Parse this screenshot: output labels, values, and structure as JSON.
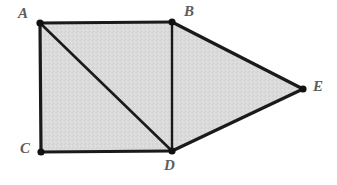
{
  "figure": {
    "canvas": {
      "width": 337,
      "height": 185
    },
    "background_color": "#ffffff",
    "fill_color": "#d9d9d9",
    "stroke_color": "#1a1a1a",
    "label_color": "#5d5d5d",
    "vertex_dot_color": "#111111",
    "vertices": [
      {
        "name": "A",
        "label": "A",
        "x": 40,
        "y": 23,
        "label_x": 18,
        "label_y": 6,
        "dot_radius": 3.6
      },
      {
        "name": "B",
        "label": "B",
        "x": 172,
        "y": 22,
        "label_x": 184,
        "label_y": 4,
        "dot_radius": 3.6
      },
      {
        "name": "C",
        "label": "C",
        "x": 41,
        "y": 152,
        "label_x": 20,
        "label_y": 141,
        "dot_radius": 3.6
      },
      {
        "name": "D",
        "label": "D",
        "x": 172,
        "y": 151,
        "label_x": 164,
        "label_y": 158,
        "dot_radius": 3.6
      },
      {
        "name": "E",
        "label": "E",
        "x": 303,
        "y": 89,
        "label_x": 313,
        "label_y": 79,
        "dot_radius": 3.6
      }
    ],
    "outline_path": "M 40 23 L 172 22 L 303 89 L 172 151 L 41 152 Z",
    "edges": [
      {
        "name": "AB",
        "from": "A",
        "to": "B",
        "x1": 40,
        "y1": 23,
        "x2": 172,
        "y2": 22,
        "width": 3.2,
        "kind": "boundary"
      },
      {
        "name": "BE",
        "from": "B",
        "to": "E",
        "x1": 172,
        "y1": 22,
        "x2": 303,
        "y2": 89,
        "width": 3.2,
        "kind": "boundary"
      },
      {
        "name": "ED",
        "from": "E",
        "to": "D",
        "x1": 303,
        "y1": 89,
        "x2": 172,
        "y2": 151,
        "width": 3.2,
        "kind": "boundary"
      },
      {
        "name": "DC",
        "from": "D",
        "to": "C",
        "x1": 172,
        "y1": 151,
        "x2": 41,
        "y2": 152,
        "width": 3.2,
        "kind": "boundary"
      },
      {
        "name": "CA",
        "from": "C",
        "to": "A",
        "x1": 41,
        "y1": 152,
        "x2": 40,
        "y2": 23,
        "width": 3.2,
        "kind": "boundary"
      },
      {
        "name": "AD",
        "from": "A",
        "to": "D",
        "x1": 40,
        "y1": 23,
        "x2": 172,
        "y2": 151,
        "width": 2.6,
        "kind": "diagonal"
      },
      {
        "name": "BD",
        "from": "B",
        "to": "D",
        "x1": 172,
        "y1": 22,
        "x2": 172,
        "y2": 151,
        "width": 2.4,
        "kind": "diagonal"
      }
    ]
  }
}
